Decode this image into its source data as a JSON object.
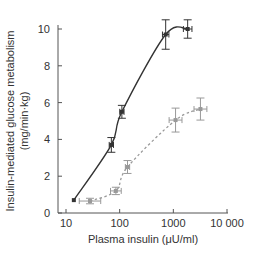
{
  "chart_data": {
    "type": "line",
    "title": "",
    "xlabel": "Plasma insulin (μU/ml)",
    "ylabel_line1": "Insulin-mediated glucose metabolism",
    "ylabel_line2": "(mg/min·kg)",
    "xscale": "log",
    "xlim": [
      10,
      10000
    ],
    "ylim": [
      0,
      10
    ],
    "xticks": [
      10,
      100,
      1000,
      10000
    ],
    "xtick_labels": [
      "10",
      "100",
      "1000",
      "10 000"
    ],
    "yticks": [
      0,
      2,
      4,
      6,
      8,
      10
    ],
    "ytick_labels": [
      "0",
      "2",
      "4",
      "6",
      "8",
      "10"
    ],
    "grid": false,
    "legend": null,
    "series": [
      {
        "name": "control",
        "style": "solid",
        "color": "#333333",
        "x": [
          14,
          70,
          110,
          720,
          1850
        ],
        "y": [
          0.7,
          3.7,
          5.5,
          9.7,
          10.0
        ],
        "y_err": [
          0.0,
          0.4,
          0.35,
          0.8,
          0.5
        ],
        "x_err_log": [
          0.0,
          0.04,
          0.04,
          0.06,
          0.08
        ]
      },
      {
        "name": "insulin-resistant",
        "style": "dashed",
        "color": "#999999",
        "x": [
          28,
          85,
          140,
          1100,
          3200
        ],
        "y": [
          0.65,
          1.2,
          2.5,
          5.05,
          5.65
        ],
        "y_err": [
          0.15,
          0.2,
          0.35,
          0.65,
          0.6
        ],
        "x_err_log": [
          0.2,
          0.1,
          0.04,
          0.12,
          0.12
        ]
      }
    ]
  }
}
